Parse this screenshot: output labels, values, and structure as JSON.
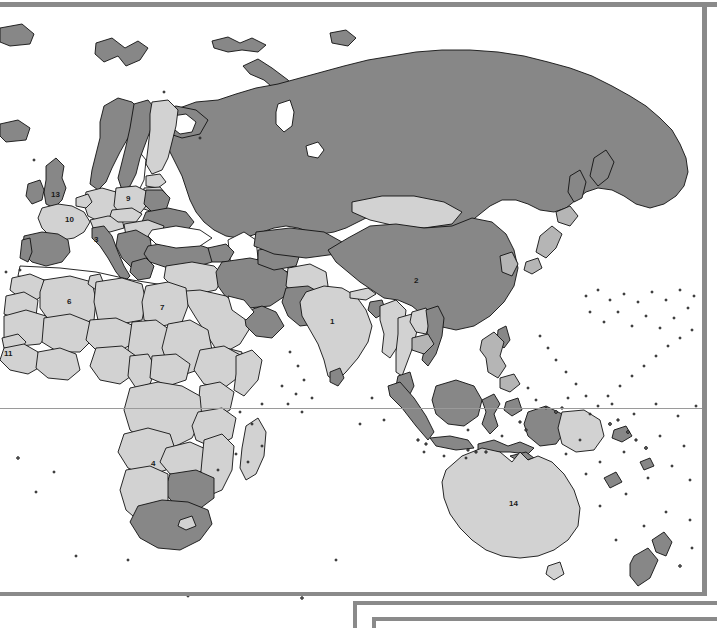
{
  "document": {
    "type": "world-map-figure",
    "title_visible": false,
    "projection_note": "Eastern hemisphere view: Europe, Africa, Asia, Oceania"
  },
  "colors": {
    "background": "#ffffff",
    "land_light": "#d2d2d2",
    "land_dark": "#878787",
    "land_mid": "#b5b5b5",
    "outline": "#111111",
    "frame": "#8a8a8a",
    "equator_line": "#9a9a9a",
    "label_text": "#1a1a1a"
  },
  "map": {
    "equator_label": "",
    "numbered_labels": [
      {
        "id": "1",
        "text": "1",
        "region": "India",
        "x": 330,
        "y": 320,
        "shade": "light"
      },
      {
        "id": "2",
        "text": "2",
        "region": "China",
        "x": 415,
        "y": 279,
        "shade": "dark"
      },
      {
        "id": "3",
        "text": "3",
        "region": "Italy",
        "x": 95,
        "y": 239,
        "shade": "dark"
      },
      {
        "id": "4",
        "text": "4",
        "region": "Zambia",
        "x": 152,
        "y": 463,
        "shade": "light"
      },
      {
        "id": "6",
        "text": "6",
        "region": "Algeria",
        "x": 69,
        "y": 301,
        "shade": "light"
      },
      {
        "id": "7",
        "text": "7",
        "region": "Egypt",
        "x": 162,
        "y": 307,
        "shade": "light"
      },
      {
        "id": "9",
        "text": "9",
        "region": "Poland",
        "x": 127,
        "y": 197,
        "shade": "light"
      },
      {
        "id": "10",
        "text": "10",
        "region": "France",
        "x": 67,
        "y": 219,
        "shade": "light"
      },
      {
        "id": "11",
        "text": "11",
        "region": "Guinea / Senegal",
        "x": 6,
        "y": 352,
        "shade": "light"
      },
      {
        "id": "13",
        "text": "13",
        "region": "United Kingdom",
        "x": 53,
        "y": 193,
        "shade": "dark"
      },
      {
        "id": "14",
        "text": "14",
        "region": "Australia",
        "x": 511,
        "y": 503,
        "shade": "light"
      }
    ],
    "legend_panel": {
      "present": true,
      "clipped_by_image_edge": true,
      "items": []
    }
  }
}
